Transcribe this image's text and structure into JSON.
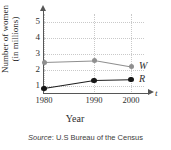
{
  "chart_data": {
    "type": "line",
    "title": "",
    "xlabel": "Year",
    "ylabel_line1": "Number of women",
    "ylabel_line2": "(in millions)",
    "x_axis_symbol": "t",
    "x": [
      1980,
      1990,
      2000
    ],
    "xtick_labels": [
      "1980",
      "1990",
      "2000"
    ],
    "ytick_labels": [
      "1",
      "2",
      "3",
      "4",
      "5"
    ],
    "ylim": [
      0,
      5.4
    ],
    "xlim": [
      1980,
      2000
    ],
    "grid": true,
    "legend_position": "right-of-line-end",
    "series": [
      {
        "name": "W",
        "label": "W",
        "color": "#8f8f8f",
        "values": [
          2.5,
          2.6,
          2.2
        ]
      },
      {
        "name": "R",
        "label": "R",
        "color": "#161616",
        "values": [
          0.85,
          1.35,
          1.4
        ]
      }
    ],
    "source_prefix": "Source",
    "source_text": ": U.S Bureau of the Census"
  }
}
